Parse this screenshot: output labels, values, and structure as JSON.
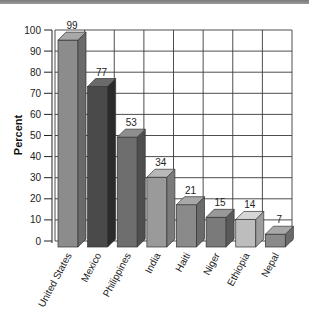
{
  "chart_data": {
    "type": "bar",
    "title": "",
    "xlabel": "",
    "ylabel": "Percent",
    "ylim": [
      0,
      100
    ],
    "yticks": [
      0,
      10,
      20,
      30,
      40,
      50,
      60,
      70,
      80,
      90,
      100
    ],
    "grid": true,
    "style": "3d",
    "categories": [
      "United States",
      "Mexico",
      "Philippines",
      "India",
      "Haiti",
      "Niger",
      "Ethiopia",
      "Nepal"
    ],
    "values": [
      99,
      77,
      53,
      34,
      21,
      15,
      14,
      7
    ],
    "colors": {
      "front": [
        "#8c8c8c",
        "#4a4a4a",
        "#6e6e6e",
        "#9a9a9a",
        "#8a8a8a",
        "#7a7a7a",
        "#bdbdbd",
        "#8a8a8a"
      ],
      "side": [
        "#6a6a6a",
        "#2a2a2a",
        "#4e4e4e",
        "#7a7a7a",
        "#6a6a6a",
        "#5a5a5a",
        "#9d9d9d",
        "#6a6a6a"
      ],
      "top": [
        "#a8a8a8",
        "#6a6a6a",
        "#8e8e8e",
        "#b8b8b8",
        "#a8a8a8",
        "#989898",
        "#d6d6d6",
        "#a8a8a8"
      ]
    }
  }
}
